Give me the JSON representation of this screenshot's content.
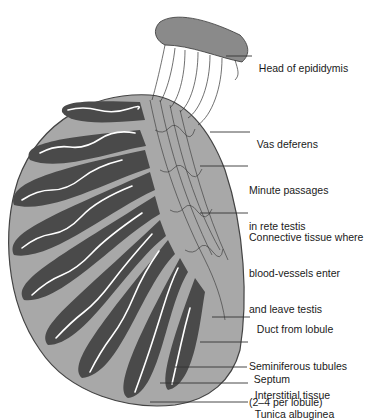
{
  "figure": {
    "colors": {
      "tunica_fill": "#a8a8a8",
      "outline": "#444444",
      "lobule_fill": "#4a4a4a",
      "tubule": "#ffffff",
      "leader_line": "#333333",
      "text": "#1a1a1a"
    },
    "labels": [
      {
        "id": "head-of-epididymis",
        "lines": [
          "Head of epididymis"
        ]
      },
      {
        "id": "vas-deferens",
        "lines": [
          "Vas deferens"
        ]
      },
      {
        "id": "minute-passages",
        "lines": [
          "Minute passages",
          "in rete testis"
        ]
      },
      {
        "id": "connective-tissue",
        "lines": [
          "Connective tissue where",
          "blood-vessels enter",
          "and leave testis"
        ]
      },
      {
        "id": "duct-from-lobule",
        "lines": [
          "Duct from lobule"
        ]
      },
      {
        "id": "seminiferous-tubules",
        "lines": [
          "Seminiferous tubules",
          "(2–4 per lobule)"
        ]
      },
      {
        "id": "septum",
        "lines": [
          "Septum"
        ]
      },
      {
        "id": "interstitial-tissue",
        "lines": [
          "Interstitial tissue"
        ]
      },
      {
        "id": "tunica-albuginea",
        "lines": [
          "Tunica albuginea"
        ]
      }
    ]
  }
}
